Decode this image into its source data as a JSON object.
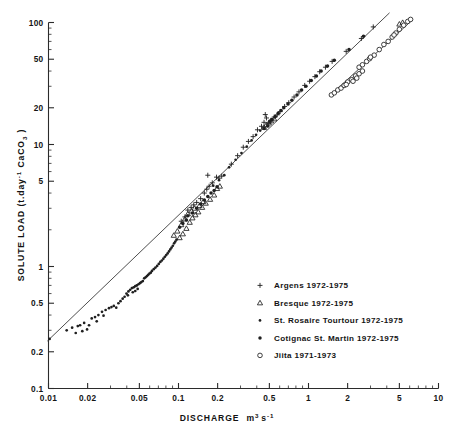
{
  "chart_data": {
    "type": "scatter",
    "title": "",
    "xlabel": "DISCHARGE  m3 s-1",
    "xlabel_parts": {
      "name": "DISCHARGE",
      "unit_base": "m",
      "unit_sup": "3",
      "unit_base2": "s",
      "unit_sup2": "-1"
    },
    "ylabel": "SOLUTE LOAD (t.day-1 CaCO3 )",
    "ylabel_parts": {
      "name": "SOLUTE LOAD (t.day",
      "sup": "-1",
      "mid": " CaCO",
      "sub": "3",
      "tail": " )"
    },
    "xscale": "log",
    "yscale": "log",
    "xlim": [
      0.01,
      10
    ],
    "ylim": [
      0.1,
      100
    ],
    "grid": false,
    "legend_position": "lower-right",
    "xticks": [
      "0.01",
      "0.02",
      "0.05",
      "0.1",
      "0.2",
      "0.5",
      "1",
      "2",
      "5",
      "10"
    ],
    "xtick_values": [
      0.01,
      0.02,
      0.05,
      0.1,
      0.2,
      0.5,
      1,
      2,
      5,
      10
    ],
    "yticks": [
      "0.1",
      "0.2",
      "0.5",
      "1",
      "5",
      "10",
      "20",
      "50",
      "100"
    ],
    "ytick_values": [
      0.1,
      0.2,
      0.5,
      1,
      5,
      10,
      20,
      50,
      100
    ],
    "fit_lines": [
      {
        "name": "main-trend",
        "x": [
          0.0098,
          4.2
        ],
        "y": [
          0.245,
          120.0
        ]
      },
      {
        "name": "jiita-trend",
        "x": [
          1.45,
          6.3
        ],
        "y": [
          25.0,
          105.0
        ]
      }
    ],
    "series": [
      {
        "name": "Argens 1972-1975",
        "marker": "plus",
        "points": [
          [
            0.105,
            2.35
          ],
          [
            0.112,
            2.55
          ],
          [
            0.118,
            2.9
          ],
          [
            0.125,
            3.05
          ],
          [
            0.131,
            3.2
          ],
          [
            0.138,
            3.35
          ],
          [
            0.148,
            3.6
          ],
          [
            0.158,
            4.0
          ],
          [
            0.165,
            4.3
          ],
          [
            0.172,
            4.55
          ],
          [
            0.182,
            4.85
          ],
          [
            0.196,
            5.4
          ],
          [
            0.168,
            5.6
          ],
          [
            0.205,
            5.3
          ],
          [
            0.215,
            5.5
          ],
          [
            0.255,
            6.9
          ],
          [
            0.285,
            8.1
          ],
          [
            0.315,
            9.5
          ],
          [
            0.345,
            10.6
          ],
          [
            0.375,
            11.6
          ],
          [
            0.405,
            13.2
          ],
          [
            0.435,
            14.1
          ],
          [
            0.455,
            15.2
          ],
          [
            0.475,
            16.5
          ],
          [
            0.465,
            17.6
          ],
          [
            0.495,
            14.9
          ],
          [
            0.515,
            15.8
          ],
          [
            0.545,
            16.8
          ],
          [
            0.575,
            17.5
          ],
          [
            0.605,
            18.6
          ],
          [
            0.655,
            20.5
          ],
          [
            0.705,
            22.0
          ],
          [
            0.775,
            24.5
          ],
          [
            0.845,
            27.0
          ],
          [
            0.935,
            30.5
          ],
          [
            1.02,
            33.0
          ],
          [
            1.12,
            36.0
          ],
          [
            1.22,
            39.5
          ],
          [
            1.35,
            43.0
          ],
          [
            1.52,
            48.0
          ],
          [
            1.95,
            58.0
          ],
          [
            2.55,
            74.0
          ],
          [
            3.15,
            92.0
          ]
        ]
      },
      {
        "name": "Bresque 1972-1975",
        "marker": "triangle",
        "points": [
          [
            0.102,
            1.72
          ],
          [
            0.108,
            1.85
          ],
          [
            0.115,
            2.05
          ],
          [
            0.122,
            2.3
          ],
          [
            0.128,
            2.5
          ],
          [
            0.135,
            2.65
          ],
          [
            0.142,
            2.8
          ],
          [
            0.152,
            3.05
          ],
          [
            0.162,
            3.3
          ],
          [
            0.175,
            3.55
          ],
          [
            0.188,
            3.85
          ],
          [
            0.198,
            4.35
          ],
          [
            0.208,
            4.55
          ],
          [
            0.118,
            2.7
          ],
          [
            0.126,
            2.85
          ],
          [
            0.133,
            3.0
          ],
          [
            0.145,
            3.15
          ],
          [
            0.155,
            3.4
          ],
          [
            0.112,
            2.45
          ],
          [
            0.105,
            2.2
          ],
          [
            0.098,
            1.95
          ],
          [
            0.092,
            1.8
          ],
          [
            0.455,
            13.8
          ],
          [
            0.475,
            14.5
          ],
          [
            0.495,
            15.0
          ],
          [
            0.515,
            15.6
          ],
          [
            0.545,
            16.2
          ],
          [
            5.0,
            97.0
          ],
          [
            5.3,
            100.0
          ]
        ]
      },
      {
        "name": "St. Rosaire Tourtour 1972-1975",
        "marker": "dot-small",
        "points": [
          [
            0.0102,
            0.255
          ],
          [
            0.0138,
            0.3
          ],
          [
            0.0152,
            0.315
          ],
          [
            0.0168,
            0.325
          ],
          [
            0.0175,
            0.33
          ],
          [
            0.0188,
            0.345
          ],
          [
            0.0198,
            0.305
          ],
          [
            0.0205,
            0.33
          ],
          [
            0.0215,
            0.375
          ],
          [
            0.0228,
            0.385
          ],
          [
            0.0242,
            0.4
          ],
          [
            0.0258,
            0.425
          ],
          [
            0.0275,
            0.44
          ],
          [
            0.0292,
            0.455
          ],
          [
            0.0305,
            0.465
          ],
          [
            0.0318,
            0.475
          ],
          [
            0.0332,
            0.46
          ],
          [
            0.0345,
            0.5
          ],
          [
            0.0358,
            0.52
          ],
          [
            0.0372,
            0.545
          ],
          [
            0.0385,
            0.565
          ],
          [
            0.0398,
            0.6
          ],
          [
            0.0412,
            0.625
          ],
          [
            0.0425,
            0.645
          ],
          [
            0.0438,
            0.665
          ],
          [
            0.0452,
            0.675
          ],
          [
            0.0465,
            0.69
          ],
          [
            0.0478,
            0.7
          ],
          [
            0.0492,
            0.715
          ],
          [
            0.0505,
            0.73
          ],
          [
            0.0518,
            0.745
          ],
          [
            0.0532,
            0.76
          ],
          [
            0.0545,
            0.8
          ],
          [
            0.0558,
            0.815
          ],
          [
            0.0572,
            0.835
          ],
          [
            0.0585,
            0.855
          ],
          [
            0.0598,
            0.875
          ],
          [
            0.0612,
            0.89
          ],
          [
            0.0625,
            0.92
          ],
          [
            0.0645,
            0.95
          ],
          [
            0.0665,
            0.98
          ],
          [
            0.0685,
            1.01
          ],
          [
            0.0705,
            1.05
          ],
          [
            0.0725,
            1.09
          ],
          [
            0.0745,
            1.12
          ],
          [
            0.0765,
            1.16
          ],
          [
            0.0785,
            1.2
          ],
          [
            0.0805,
            1.24
          ],
          [
            0.0825,
            1.28
          ],
          [
            0.0845,
            1.33
          ],
          [
            0.0865,
            1.38
          ],
          [
            0.0885,
            1.43
          ],
          [
            0.0905,
            1.48
          ],
          [
            0.0925,
            1.55
          ],
          [
            0.0945,
            1.6
          ],
          [
            0.0965,
            1.66
          ],
          [
            0.0465,
            0.63
          ],
          [
            0.0485,
            0.655
          ],
          [
            0.0445,
            0.615
          ],
          [
            0.0408,
            0.58
          ],
          [
            0.0265,
            0.395
          ],
          [
            0.0235,
            0.355
          ],
          [
            0.0182,
            0.295
          ],
          [
            0.0162,
            0.285
          ],
          [
            0.245,
            6.5
          ],
          [
            0.275,
            7.5
          ],
          [
            0.305,
            8.5
          ],
          [
            0.335,
            9.6
          ],
          [
            0.365,
            10.8
          ],
          [
            0.395,
            12.0
          ],
          [
            0.425,
            13.0
          ],
          [
            0.205,
            5.1
          ],
          [
            0.225,
            5.6
          ],
          [
            0.185,
            4.6
          ]
        ]
      },
      {
        "name": "Cotignac St. Martin 1972-1975",
        "marker": "dot",
        "points": [
          [
            0.118,
            2.6
          ],
          [
            0.128,
            2.75
          ],
          [
            0.138,
            3.0
          ],
          [
            0.148,
            3.25
          ],
          [
            0.158,
            3.5
          ],
          [
            0.168,
            3.75
          ],
          [
            0.178,
            4.0
          ],
          [
            0.188,
            4.2
          ],
          [
            0.198,
            4.5
          ],
          [
            0.115,
            2.4
          ],
          [
            0.108,
            2.25
          ],
          [
            0.102,
            2.1
          ],
          [
            0.455,
            13.5
          ],
          [
            0.485,
            14.2
          ],
          [
            0.505,
            15.5
          ],
          [
            0.525,
            16.0
          ],
          [
            0.555,
            17.0
          ],
          [
            0.585,
            18.0
          ],
          [
            0.615,
            19.0
          ],
          [
            0.645,
            20.0
          ],
          [
            0.695,
            21.5
          ],
          [
            0.745,
            23.0
          ],
          [
            0.815,
            25.5
          ],
          [
            0.885,
            28.0
          ],
          [
            0.955,
            30.0
          ],
          [
            1.05,
            33.5
          ],
          [
            1.15,
            36.5
          ],
          [
            1.25,
            40.0
          ],
          [
            1.4,
            44.0
          ],
          [
            1.58,
            49.0
          ],
          [
            2.05,
            60.0
          ],
          [
            2.65,
            77.0
          ]
        ]
      },
      {
        "name": "Jiita 1971-1973",
        "marker": "circle",
        "points": [
          [
            1.5,
            25.5
          ],
          [
            1.58,
            26.5
          ],
          [
            1.68,
            28.0
          ],
          [
            1.78,
            29.0
          ],
          [
            1.88,
            30.5
          ],
          [
            2.0,
            32.5
          ],
          [
            2.15,
            34.0
          ],
          [
            2.3,
            36.5
          ],
          [
            2.45,
            38.0
          ],
          [
            2.6,
            40.0
          ],
          [
            2.45,
            43.0
          ],
          [
            2.6,
            45.0
          ],
          [
            2.8,
            48.0
          ],
          [
            2.95,
            50.5
          ],
          [
            3.2,
            54.0
          ],
          [
            3.5,
            60.0
          ],
          [
            3.8,
            66.0
          ],
          [
            4.1,
            70.0
          ],
          [
            4.4,
            76.0
          ],
          [
            4.7,
            82.0
          ],
          [
            5.0,
            88.0
          ],
          [
            5.4,
            95.0
          ],
          [
            5.8,
            102.0
          ],
          [
            6.1,
            106.0
          ],
          [
            2.2,
            33.0
          ],
          [
            2.35,
            35.0
          ],
          [
            1.95,
            31.0
          ],
          [
            3.0,
            52.0
          ],
          [
            4.55,
            79.0
          ]
        ]
      }
    ],
    "legend": [
      {
        "marker": "plus",
        "label": "Argens 1972-1975"
      },
      {
        "marker": "triangle",
        "label": "Bresque 1972-1975"
      },
      {
        "marker": "dot-small",
        "label": "St. Rosaire Tourtour 1972-1975"
      },
      {
        "marker": "dot",
        "label": "Cotignac St. Martin 1972-1975"
      },
      {
        "marker": "circle",
        "label": "Jiita 1971-1973"
      }
    ]
  },
  "colors": {
    "axis": "#2b2b2b",
    "marker": "#1f1f1f",
    "line": "#3a3a3a",
    "background": "#ffffff",
    "text": "#141414"
  }
}
